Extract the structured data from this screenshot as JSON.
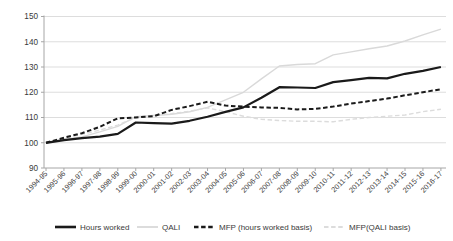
{
  "chart_data": {
    "type": "line",
    "title": "",
    "xlabel": "",
    "ylabel": "",
    "categories": [
      "1994-95",
      "1995-96",
      "1996-97",
      "1997-98",
      "1998-99",
      "1999-00",
      "2000-01",
      "2001-02",
      "2002-03",
      "2003-04",
      "2004-05",
      "2005-06",
      "2006-07",
      "2007-08",
      "2008-09",
      "2009-10",
      "2010-11",
      "2011-12",
      "2012-13",
      "2013-14",
      "2014-15",
      "2015-16",
      "2016-17"
    ],
    "series": [
      {
        "name": "Hours worked",
        "style": "solid",
        "color": "#1a1a1a",
        "width": 2.2,
        "values": [
          100,
          101,
          101.8,
          102.4,
          103.5,
          108,
          107.8,
          107.6,
          108.7,
          110.3,
          112.2,
          114,
          117.8,
          122,
          121.9,
          121.7,
          124,
          124.8,
          125.7,
          125.5,
          127.3,
          128.5,
          130
        ]
      },
      {
        "name": "QALI",
        "style": "solid",
        "color": "#d9d9d9",
        "width": 1.4,
        "values": [
          100,
          101.3,
          102.3,
          104.3,
          106.5,
          110.3,
          110.8,
          111.3,
          112.3,
          114,
          117,
          120,
          125.3,
          130.4,
          131,
          131.3,
          134.8,
          136,
          137.2,
          138.3,
          140.3,
          142.7,
          145
        ]
      },
      {
        "name": "MFP (hours worked basis)",
        "style": "dashed",
        "color": "#1a1a1a",
        "width": 2,
        "values": [
          100,
          102,
          103.8,
          106.3,
          109.7,
          110,
          110.5,
          113,
          114.5,
          116.2,
          114.7,
          114.3,
          114,
          113.8,
          113.2,
          113.4,
          114.3,
          115.5,
          116.5,
          117.5,
          118.8,
          120,
          121.2
        ]
      },
      {
        "name": "MFP(QALI basis)",
        "style": "dashed",
        "color": "#dcdcdc",
        "width": 1.4,
        "values": [
          100,
          101.8,
          103.3,
          105,
          107,
          110,
          110.8,
          111.5,
          112.5,
          113.8,
          112.3,
          110.5,
          109.3,
          108.8,
          108.5,
          108.5,
          108.3,
          109.3,
          110,
          110.5,
          111,
          112.3,
          113.3
        ]
      }
    ],
    "ylim": [
      90,
      150
    ],
    "ytick_step": 10,
    "ytick_labels": [
      "90",
      "100",
      "110",
      "120",
      "130",
      "140",
      "150"
    ],
    "grid": "horizontal",
    "legend_position": "bottom",
    "legend_entries": [
      "Hours worked",
      "QALI",
      "MFP (hours worked basis)",
      "MFP(QALI basis)"
    ],
    "axis_color": "#a6a6a6",
    "grid_color": "#d9d9d9",
    "text_color": "#3a3a3a"
  }
}
